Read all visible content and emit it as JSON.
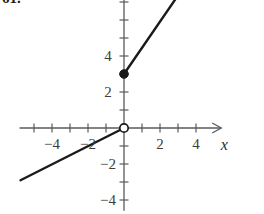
{
  "figure": {
    "problem_number": "61.",
    "width": 264,
    "height": 214
  },
  "axes": {
    "x_label": "x",
    "y_label": "y",
    "x_tick_labels": [
      {
        "value": -4,
        "text": "−4"
      },
      {
        "value": -2,
        "text": "−2"
      },
      {
        "value": 2,
        "text": "2"
      },
      {
        "value": 4,
        "text": "4"
      }
    ],
    "y_tick_labels": [
      {
        "value": 4,
        "text": "4"
      },
      {
        "value": 2,
        "text": "2"
      },
      {
        "value": -2,
        "text": "−2"
      },
      {
        "value": -4,
        "text": "−4"
      }
    ],
    "axis_color": "#5a5a5a",
    "curve_color": "#1a1a1a"
  },
  "chart_data": {
    "type": "line",
    "title": "",
    "xlabel": "x",
    "ylabel": "y",
    "xlim": [
      -5.8,
      5.4
    ],
    "ylim": [
      -4.6,
      7.9
    ],
    "grid": false,
    "legend": "none",
    "xticks": [
      -4,
      -2,
      2,
      4
    ],
    "yticks": [
      4,
      2,
      -2,
      -4
    ],
    "xtick_step": 1,
    "ytick_step": 1,
    "series": [
      {
        "name": "left-branch",
        "type": "segment",
        "slope": 0.5,
        "intercept": 0,
        "x": [
          -5.75,
          0
        ],
        "y": [
          -2.9,
          0
        ],
        "endpoint_open_at": [
          0,
          0
        ]
      },
      {
        "name": "right-branch",
        "type": "segment",
        "slope": 1.45,
        "intercept": 3,
        "x": [
          0,
          3.3
        ],
        "y": [
          3,
          7.8
        ],
        "endpoint_closed_at": [
          0,
          3
        ]
      }
    ],
    "points": [
      {
        "label": "open-circle",
        "x": 0,
        "y": 0,
        "filled": false
      },
      {
        "label": "closed-circle",
        "x": 0,
        "y": 3,
        "filled": true
      }
    ]
  }
}
